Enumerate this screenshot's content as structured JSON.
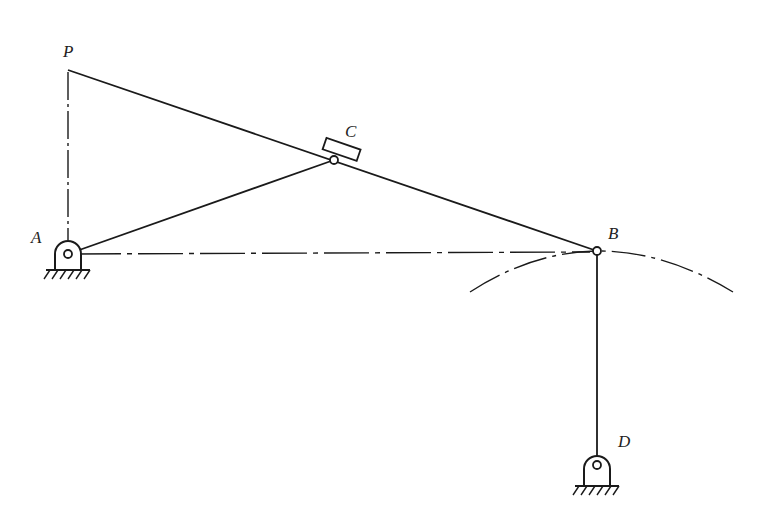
{
  "diagram": {
    "type": "linkage-mechanism",
    "line_color": "#1a1a1a",
    "background": "#ffffff",
    "points": {
      "P": {
        "label": "P",
        "x": 68,
        "y": 70
      },
      "A": {
        "label": "A",
        "x": 68,
        "y": 254
      },
      "C": {
        "label": "C",
        "x": 334,
        "y": 160
      },
      "B": {
        "label": "B",
        "x": 597,
        "y": 251
      },
      "D": {
        "label": "D",
        "x": 597,
        "y": 463
      }
    },
    "links": [
      {
        "from": "P",
        "to": "B",
        "style": "solid",
        "description": "rod PB through slider C"
      },
      {
        "from": "A",
        "to": "C",
        "style": "solid",
        "description": "crank AC"
      },
      {
        "from": "B",
        "to": "D",
        "style": "solid",
        "description": "rocker BD"
      },
      {
        "from": "P",
        "to": "A",
        "style": "dash-dot",
        "description": "construction line PA"
      },
      {
        "from": "A",
        "to": "B",
        "style": "dash-dot",
        "description": "construction line AB"
      }
    ],
    "arc": {
      "center": "D",
      "through": "B",
      "style": "dash-dot",
      "description": "path of B about D"
    },
    "supports": [
      "A",
      "D"
    ],
    "slider": "C"
  }
}
